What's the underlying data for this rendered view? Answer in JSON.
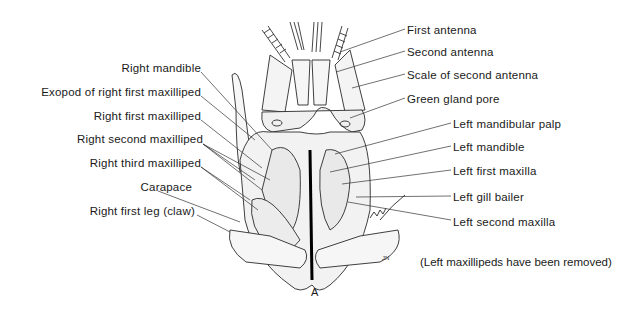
{
  "figure": {
    "caption": "A",
    "note": "(Left maxillipeds have been removed)",
    "signature": "JN",
    "left_labels": [
      {
        "text": "Right mandible",
        "y": 67
      },
      {
        "text": "Exopod of right first maxilliped",
        "y": 91
      },
      {
        "text": "Right first maxilliped",
        "y": 115
      },
      {
        "text": "Right second maxilliped",
        "y": 139
      },
      {
        "text": "Right third maxilliped",
        "y": 162
      },
      {
        "text": "Carapace",
        "y": 186
      },
      {
        "text": "Right first leg (claw)",
        "y": 210
      }
    ],
    "right_labels": [
      {
        "text": "First antenna",
        "y": 24
      },
      {
        "text": "Second antenna",
        "y": 46
      },
      {
        "text": "Scale of second antenna",
        "y": 69
      },
      {
        "text": "Green gland pore",
        "y": 93
      },
      {
        "text": "Left mandibular palp",
        "y": 117
      },
      {
        "text": "Left mandible",
        "y": 141
      },
      {
        "text": "Left first maxilla",
        "y": 165
      },
      {
        "text": "Left gill bailer",
        "y": 190
      },
      {
        "text": "Left second maxilla",
        "y": 215
      }
    ]
  }
}
